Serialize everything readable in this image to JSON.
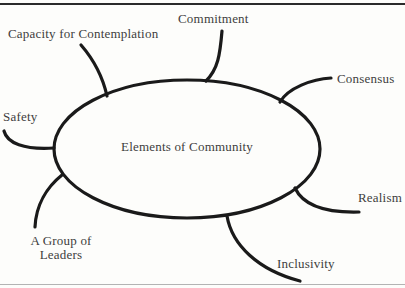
{
  "diagram": {
    "type": "mind-map",
    "center": {
      "label": "Elements of Community"
    },
    "branches": [
      {
        "id": "commitment",
        "label": "Commitment",
        "position": "top"
      },
      {
        "id": "capacity-for-contemplation",
        "label": "Capacity for Contemplation",
        "position": "top-left"
      },
      {
        "id": "consensus",
        "label": "Consensus",
        "position": "right-upper"
      },
      {
        "id": "safety",
        "label": "Safety",
        "position": "left"
      },
      {
        "id": "realism",
        "label": "Realism",
        "position": "right-lower"
      },
      {
        "id": "a-group-of-leaders",
        "label": "A Group of Leaders",
        "position": "bottom-left"
      },
      {
        "id": "inclusivity",
        "label": "Inclusivity",
        "position": "bottom"
      }
    ],
    "colors": {
      "stroke": "#1a1a1a",
      "text": "#3d3d3d",
      "background": "#fdfdfb",
      "top_rule": "#2b2b2b",
      "bottom_rule": "#b3b3b3"
    }
  }
}
